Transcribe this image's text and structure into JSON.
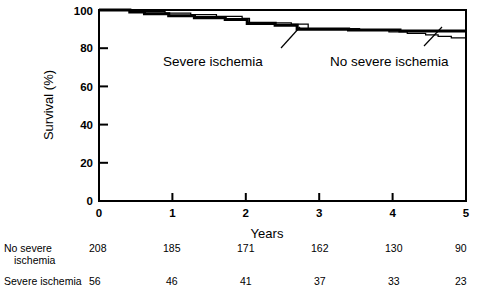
{
  "chart_data": {
    "type": "line",
    "title": "",
    "subtitle": "",
    "xlabel": "Years",
    "ylabel": "Survival (%)",
    "xlim": [
      0,
      5
    ],
    "ylim": [
      0,
      100
    ],
    "xticks": [
      "0",
      "1",
      "2",
      "3",
      "4",
      "5"
    ],
    "yticks": [
      "0",
      "20",
      "40",
      "60",
      "80",
      "100"
    ],
    "grid": false,
    "legend_position": "inline-annotations",
    "step_style": "kaplan-meier",
    "annotations": [
      {
        "text": "Severe ischemia",
        "points_to_year": 2.72,
        "points_to_survival": 90
      },
      {
        "text": "No severe ischemia",
        "points_to_year": 4.62,
        "points_to_survival": 87
      }
    ],
    "series": [
      {
        "name": "Severe ischemia",
        "line_weight": "thick",
        "color": "#000000",
        "points": [
          [
            0.0,
            100
          ],
          [
            0.42,
            100
          ],
          [
            0.42,
            99
          ],
          [
            0.62,
            99
          ],
          [
            0.62,
            98
          ],
          [
            0.95,
            98
          ],
          [
            0.95,
            97
          ],
          [
            1.3,
            97
          ],
          [
            1.3,
            96
          ],
          [
            1.72,
            96
          ],
          [
            1.72,
            95
          ],
          [
            2.02,
            95
          ],
          [
            2.02,
            93
          ],
          [
            2.4,
            93
          ],
          [
            2.4,
            92
          ],
          [
            2.7,
            92
          ],
          [
            2.7,
            90
          ],
          [
            3.4,
            90
          ],
          [
            3.4,
            89.5
          ],
          [
            4.1,
            89.5
          ],
          [
            4.1,
            89
          ],
          [
            5.0,
            89
          ]
        ]
      },
      {
        "name": "No severe ischemia",
        "line_weight": "thin",
        "color": "#000000",
        "points": [
          [
            0.0,
            100
          ],
          [
            0.55,
            100
          ],
          [
            0.55,
            99.2
          ],
          [
            0.9,
            99.2
          ],
          [
            0.9,
            98.4
          ],
          [
            1.25,
            98.4
          ],
          [
            1.25,
            97.6
          ],
          [
            1.6,
            97.6
          ],
          [
            1.6,
            96.6
          ],
          [
            1.95,
            96.6
          ],
          [
            1.95,
            95.6
          ],
          [
            2.05,
            95.6
          ],
          [
            2.05,
            93.2
          ],
          [
            2.62,
            93.2
          ],
          [
            2.62,
            92.6
          ],
          [
            2.85,
            92.6
          ],
          [
            2.85,
            90.2
          ],
          [
            3.55,
            90.2
          ],
          [
            3.55,
            89.6
          ],
          [
            3.95,
            89.6
          ],
          [
            3.95,
            88.6
          ],
          [
            4.2,
            88.6
          ],
          [
            4.2,
            87.8
          ],
          [
            4.45,
            87.8
          ],
          [
            4.45,
            87.0
          ],
          [
            4.62,
            87.0
          ],
          [
            4.62,
            86.2
          ],
          [
            4.8,
            86.2
          ],
          [
            4.8,
            85.4
          ],
          [
            5.0,
            85.4
          ]
        ]
      }
    ]
  },
  "risk_table": {
    "row_labels": [
      {
        "line1": "No severe",
        "line2": "ischemia"
      },
      {
        "line1": "Severe ischemia",
        "line2": ""
      }
    ],
    "rows": [
      {
        "label": "No severe ischemia",
        "values": [
          "208",
          "185",
          "171",
          "162",
          "130",
          "90"
        ]
      },
      {
        "label": "Severe ischemia",
        "values": [
          "56",
          "46",
          "41",
          "37",
          "33",
          "23"
        ]
      }
    ]
  }
}
